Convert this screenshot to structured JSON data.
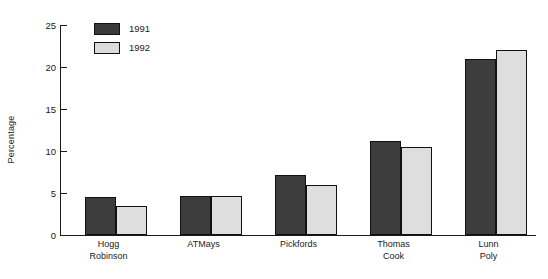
{
  "chart_data": {
    "type": "bar",
    "title": "",
    "subtitle": "",
    "xlabel": "",
    "ylabel": "Percentage",
    "ylim": [
      0,
      25
    ],
    "yticks": [
      0,
      5,
      10,
      15,
      20,
      25
    ],
    "ytick_labels": [
      "0",
      "5",
      "10",
      "15",
      "20",
      "25"
    ],
    "grid": false,
    "legend_position": "top-left",
    "categories": [
      "Hogg Robinson",
      "ATMays",
      "Pickfords",
      "Thomas Cook",
      "Lunn Poly"
    ],
    "category_lines": [
      [
        "Hogg",
        "Robinson"
      ],
      [
        "ATMays",
        ""
      ],
      [
        "Pickfords",
        ""
      ],
      [
        "Thomas",
        "Cook"
      ],
      [
        "Lunn",
        "Poly"
      ]
    ],
    "series": [
      {
        "name": "1991",
        "color": "#3d3d3d",
        "values": [
          4.5,
          4.6,
          7.2,
          11.2,
          21.0
        ]
      },
      {
        "name": "1992",
        "color": "#dedede",
        "values": [
          3.4,
          4.6,
          6.0,
          10.5,
          22.0
        ]
      }
    ]
  },
  "legend": {
    "entries": [
      {
        "label": "1991"
      },
      {
        "label": "1992"
      }
    ]
  },
  "axis": {
    "y_title": "Percentage"
  }
}
